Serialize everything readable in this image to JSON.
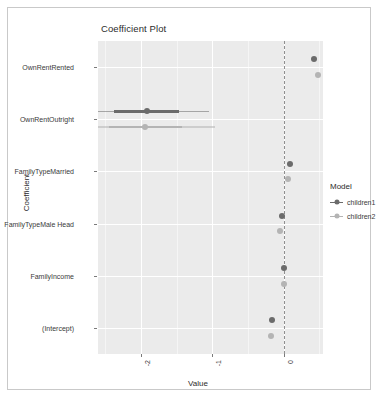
{
  "chart_data": {
    "type": "scatter",
    "title": "Coefficient Plot",
    "xlabel": "Value",
    "ylabel": "Coefficient",
    "grid": true,
    "legend_position": "right",
    "legend_title": "Model",
    "xlim": [
      -2.6,
      0.55
    ],
    "xticks": [
      -2,
      -1,
      0
    ],
    "xtick_labels": [
      "-2",
      "-1",
      "0"
    ],
    "zero_reference_line": 0,
    "categories": [
      "OwnRentRented",
      "OwnRentOutright",
      "FamilyTypeMarried",
      "FamilyTypeMale Head",
      "FamilyIncome",
      "(Intercept)"
    ],
    "series": [
      {
        "name": "children1",
        "color": "#6b6b6b",
        "points": [
          {
            "coefficient": "OwnRentRented",
            "value": 0.42,
            "low": 0.42,
            "high": 0.42
          },
          {
            "coefficient": "OwnRentOutright",
            "value": -1.92,
            "low": -2.38,
            "high": -1.46
          },
          {
            "coefficient": "FamilyTypeMarried",
            "value": 0.09,
            "low": 0.09,
            "high": 0.09
          },
          {
            "coefficient": "FamilyTypeMale Head",
            "value": -0.03,
            "low": -0.03,
            "high": -0.03
          },
          {
            "coefficient": "FamilyIncome",
            "value": 0.0,
            "low": 0.0,
            "high": 0.0
          },
          {
            "coefficient": "(Intercept)",
            "value": -0.16,
            "low": -0.16,
            "high": -0.16
          }
        ]
      },
      {
        "name": "children2",
        "color": "#b4b4b4",
        "points": [
          {
            "coefficient": "OwnRentRented",
            "value": 0.48,
            "low": 0.48,
            "high": 0.48
          },
          {
            "coefficient": "OwnRentOutright",
            "value": -1.94,
            "low": -2.44,
            "high": -1.42
          },
          {
            "coefficient": "FamilyTypeMarried",
            "value": 0.06,
            "low": 0.06,
            "high": 0.06
          },
          {
            "coefficient": "FamilyTypeMale Head",
            "value": -0.05,
            "low": -0.05,
            "high": -0.05
          },
          {
            "coefficient": "FamilyIncome",
            "value": 0.0,
            "low": 0.0,
            "high": 0.0
          },
          {
            "coefficient": "(Intercept)",
            "value": -0.18,
            "low": -0.18,
            "high": -0.18
          }
        ]
      }
    ]
  },
  "legend": {
    "title": "Model",
    "items": [
      {
        "label": "children1",
        "color": "#6b6b6b"
      },
      {
        "label": "children2",
        "color": "#b4b4b4"
      }
    ]
  }
}
